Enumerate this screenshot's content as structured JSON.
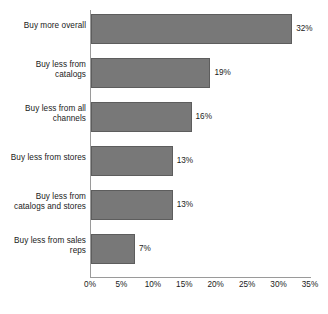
{
  "chart_data": {
    "type": "bar",
    "orientation": "horizontal",
    "title": "",
    "subtitle": "",
    "xlabel": "",
    "ylabel": "",
    "xlim": [
      0,
      35
    ],
    "xticks": [
      "0%",
      "5%",
      "10%",
      "15%",
      "20%",
      "25%",
      "30%",
      "35%"
    ],
    "xtick_values": [
      0,
      5,
      10,
      15,
      20,
      25,
      30,
      35
    ],
    "grid": false,
    "legend": false,
    "categories": [
      "Buy more overall",
      "Buy less from catalogs",
      "Buy less from all channels",
      "Buy less from stores",
      "Buy less from catalogs and stores",
      "Buy less from sales reps"
    ],
    "values": [
      32,
      19,
      16,
      13,
      13,
      7
    ],
    "value_labels": [
      "32%",
      "19%",
      "16%",
      "13%",
      "13%",
      "7%"
    ],
    "bar_color": "#787878",
    "bar_border_color": "#5d5d5d",
    "axis_color": "#9a9a9a",
    "text_color": "#1a1a1a",
    "background": "#ffffff"
  },
  "category_lines": [
    [
      "Buy more overall"
    ],
    [
      "Buy less from",
      "catalogs"
    ],
    [
      "Buy less from all",
      "channels"
    ],
    [
      "Buy less from stores"
    ],
    [
      "Buy less from",
      "catalogs and stores"
    ],
    [
      "Buy less from sales",
      "reps"
    ]
  ]
}
